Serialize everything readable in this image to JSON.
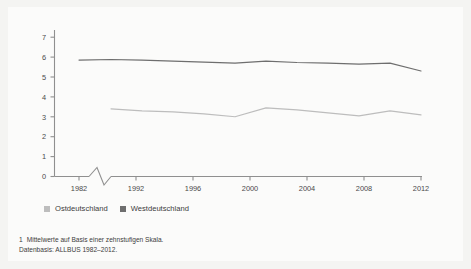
{
  "chart_data": {
    "type": "line",
    "title": "",
    "subtitle": "",
    "xlabel": "",
    "ylabel": "",
    "ylim": [
      0,
      7
    ],
    "yticks": [
      0,
      1,
      2,
      3,
      4,
      5,
      6,
      7
    ],
    "xticks": [
      "1982",
      "1992",
      "1996",
      "2000",
      "2004",
      "2008",
      "2012"
    ],
    "grid": false,
    "axis_break": true,
    "axis_break_note": "zigzag break on x-axis between 1982 and 1992",
    "legend_position": "below-left",
    "x": [
      1982,
      1992,
      1994,
      1996,
      1998,
      2000,
      2002,
      2004,
      2006,
      2008,
      2010,
      2012
    ],
    "series": [
      {
        "name": "Ostdeutschland",
        "color": "#bdbdbd",
        "x": [
          1992,
          1994,
          1996,
          1998,
          2000,
          2002,
          2004,
          2006,
          2008,
          2010,
          2012
        ],
        "values": [
          3.4,
          3.3,
          3.25,
          3.15,
          3.0,
          3.45,
          3.35,
          3.2,
          3.05,
          3.3,
          3.1
        ]
      },
      {
        "name": "Westdeutschland",
        "color": "#6e6e6e",
        "x": [
          1982,
          1992,
          1994,
          1996,
          1998,
          2000,
          2002,
          2004,
          2006,
          2008,
          2010,
          2012
        ],
        "values": [
          5.85,
          5.88,
          5.85,
          5.8,
          5.75,
          5.7,
          5.8,
          5.73,
          5.7,
          5.65,
          5.7,
          5.3
        ]
      }
    ]
  },
  "legend": {
    "items": [
      {
        "label": "Ostdeutschland",
        "color": "#bdbdbd"
      },
      {
        "label": "Westdeutschland",
        "color": "#6e6e6e"
      }
    ]
  },
  "footnote": {
    "marker": "1",
    "line1": "Mittelwerte auf Basis einer zehnstufigen Skala.",
    "line2": "Datenbasis: ALLBUS 1982–2012."
  }
}
